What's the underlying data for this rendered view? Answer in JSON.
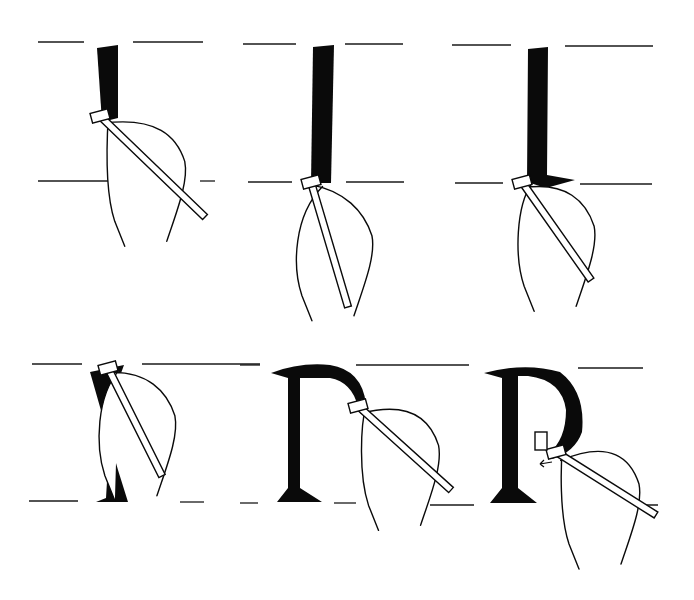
{
  "illustration": {
    "subject": "Calligraphy broad-nib pen stroke sequence forming the letter P",
    "background": "#ffffff",
    "ink_color": "#0a0a0a",
    "panels": [
      {
        "id": 1,
        "stage": "downstroke-start",
        "top_line_y": 42,
        "base_line_y": 181,
        "guides": [
          [
            38,
            42,
            84,
            42
          ],
          [
            133,
            42,
            203,
            42
          ],
          [
            38,
            181,
            112,
            181
          ],
          [
            200,
            181,
            215,
            181
          ]
        ],
        "stroke": "M97,48 L118,45 L118,118 L102,122 Z",
        "nib": [
          100,
          116
        ],
        "pen_end": [
          205,
          217
        ]
      },
      {
        "id": 2,
        "stage": "downstroke-complete",
        "top_line_y": 44,
        "base_line_y": 182,
        "guides": [
          [
            243,
            44,
            296,
            44
          ],
          [
            345,
            44,
            403,
            44
          ],
          [
            248,
            182,
            292,
            182
          ],
          [
            346,
            182,
            404,
            182
          ]
        ],
        "stroke": "M313,47 L334,45 L331,183 L311,183 Z",
        "nib": [
          311,
          182
        ],
        "pen_end": [
          348,
          307
        ]
      },
      {
        "id": 3,
        "stage": "foot-serif",
        "top_line_y": 45,
        "base_line_y": 183,
        "guides": [
          [
            452,
            45,
            511,
            45
          ],
          [
            565,
            46,
            653,
            46
          ],
          [
            455,
            183,
            503,
            183
          ],
          [
            580,
            184,
            652,
            184
          ]
        ],
        "stroke": "M528,49 L548,47 L547,175 L575,180 L546,188 L527,182 Z",
        "nib": [
          522,
          182
        ],
        "pen_end": [
          591,
          280
        ]
      },
      {
        "id": 4,
        "stage": "bowl-start-head-serif",
        "top_line_y": 364,
        "base_line_y": 501,
        "guides": [
          [
            32,
            364,
            82,
            364
          ],
          [
            142,
            364,
            260,
            364
          ],
          [
            29,
            501,
            78,
            501
          ],
          [
            180,
            502,
            204,
            502
          ]
        ],
        "stroke": "M90,372 L124,365 L112,398 L106,498 L96,502 L128,502 L118,470 Z",
        "nib": [
          108,
          368
        ],
        "pen_end": [
          162,
          476
        ]
      },
      {
        "id": 5,
        "stage": "bowl-curve",
        "top_line_y": 365,
        "base_line_y": 503,
        "guides": [
          [
            240,
            365,
            260,
            365
          ],
          [
            356,
            365,
            469,
            365
          ],
          [
            240,
            503,
            258,
            503
          ],
          [
            334,
            503,
            356,
            503
          ],
          [
            430,
            505,
            474,
            505
          ]
        ],
        "stroke": "M271,373 Q300,362 330,365 Q362,370 366,404 L358,407 Q352,382 330,378 L300,378 L300,488 L322,502 L277,502 L288,488 L288,378 Z",
        "nib": [
          358,
          406
        ],
        "pen_end": [
          451,
          490
        ]
      },
      {
        "id": 6,
        "stage": "bowl-complete",
        "top_line_y": 368,
        "base_line_y": 505,
        "guides": [
          [
            578,
            368,
            643,
            368
          ],
          [
            620,
            505,
            658,
            505
          ]
        ],
        "stroke": "M484,373 Q525,362 560,372 Q586,392 582,432 Q575,452 552,459 L548,454 Q566,440 566,410 Q562,380 528,376 L518,376 L518,488 L537,503 L490,503 L502,488 L502,378 Z",
        "nib": [
          556,
          452
        ],
        "pen_end": [
          656,
          515
        ],
        "annotation": "direction-arrow-left"
      }
    ]
  }
}
